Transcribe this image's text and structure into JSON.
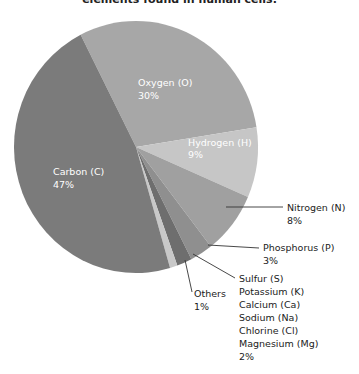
{
  "chart_data": {
    "type": "pie",
    "title": "elements found in human cells.",
    "categories": [
      "Oxygen (O)",
      "Hydrogen (H)",
      "Nitrogen (N)",
      "Phosphorus (P)",
      "Sulfur (S) / Potassium (K) / Calcium (Ca) / Sodium (Na) / Chlorine (Cl) / Magnesium (Mg)",
      "Others",
      "Carbon (C)"
    ],
    "values": [
      30,
      9,
      8,
      3,
      2,
      1,
      47
    ],
    "unit": "%",
    "start_angle_deg": 333,
    "direction": "clockwise",
    "legend": "none (direct labels)"
  },
  "title": "elements found in human cells.",
  "slices": [
    {
      "name": "Oxygen (O)",
      "value": 30,
      "pct": "30%",
      "color": "#a7a7a7"
    },
    {
      "name": "Hydrogen (H)",
      "value": 9,
      "pct": "9%",
      "color": "#c6c6c6"
    },
    {
      "name": "Nitrogen (N)",
      "value": 8,
      "pct": "8%",
      "color": "#a0a0a0"
    },
    {
      "name": "Phosphorus (P)",
      "value": 3,
      "pct": "3%",
      "color": "#8f8f8f"
    },
    {
      "name": "Sulfur group",
      "value": 2,
      "pct": "2%",
      "color": "#6e6e6e"
    },
    {
      "name": "Others",
      "value": 1,
      "pct": "1%",
      "color": "#c8c8c8"
    },
    {
      "name": "Carbon (C)",
      "value": 47,
      "pct": "47%",
      "color": "#7b7b7b"
    }
  ],
  "labels": {
    "oxygen": {
      "name": "Oxygen (O)",
      "pct": "30%"
    },
    "hydrogen": {
      "name": "Hydrogen (H)",
      "pct": "9%"
    },
    "carbon": {
      "name": "Carbon (C)",
      "pct": "47%"
    },
    "nitrogen": {
      "name": "Nitrogen (N)",
      "pct": "8%"
    },
    "phosphorus": {
      "name": "Phosphorus (P)",
      "pct": "3%"
    },
    "others": {
      "name": "Others",
      "pct": "1%"
    },
    "sulfur_group": {
      "lines": [
        "Sulfur (S)",
        "Potassium (K)",
        "Calcium (Ca)",
        "Sodium (Na)",
        "Chlorine (Cl)",
        "Magnesium (Mg)"
      ],
      "pct": "2%"
    }
  }
}
